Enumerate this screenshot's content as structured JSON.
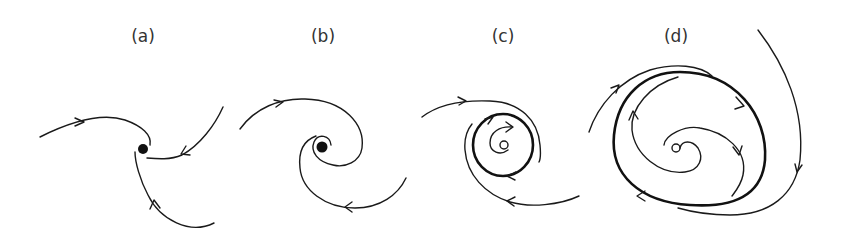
{
  "figure": {
    "panels": [
      {
        "id": "a",
        "label": "(a)",
        "description": "stable spiral point (attractor)"
      },
      {
        "id": "b",
        "label": "(b)",
        "description": "unstable spiral point"
      },
      {
        "id": "c",
        "label": "(c)",
        "description": "stable limit cycle"
      },
      {
        "id": "d",
        "label": "(d)",
        "description": "limit cycle"
      }
    ],
    "colors": {
      "stroke": "#1a1a1a",
      "background": "#ffffff",
      "label": "#333333"
    }
  }
}
